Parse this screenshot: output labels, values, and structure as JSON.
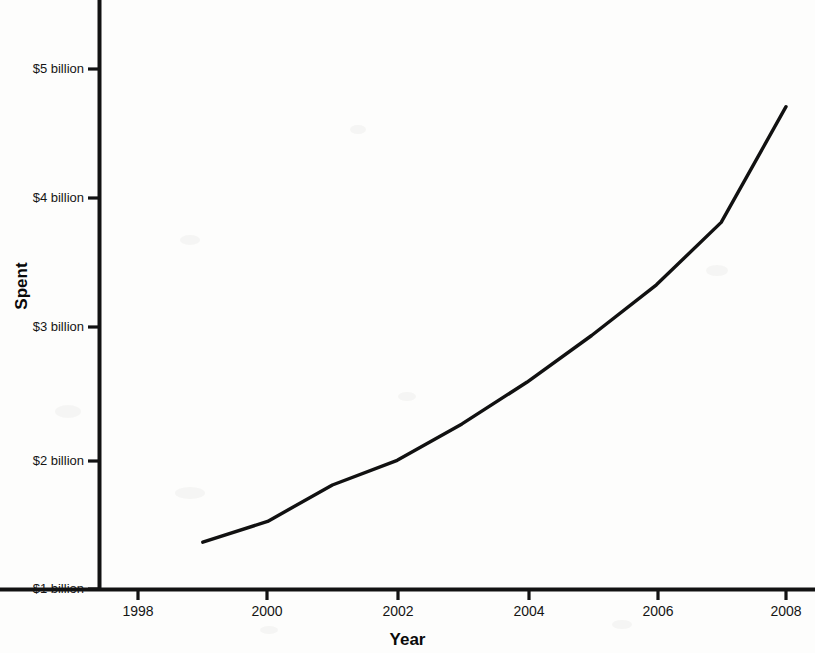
{
  "chart_data": {
    "type": "line",
    "title": "",
    "xlabel": "Year",
    "ylabel": "Spent",
    "x": [
      1999,
      2000,
      2001,
      2002,
      2003,
      2004,
      2005,
      2006,
      2007,
      2008
    ],
    "values": [
      1.36,
      1.52,
      1.8,
      1.99,
      2.27,
      2.59,
      2.95,
      3.34,
      3.82,
      4.71
    ],
    "series": [
      {
        "name": "Spent",
        "values": [
          1.36,
          1.52,
          1.8,
          1.99,
          2.27,
          2.59,
          2.95,
          3.34,
          3.82,
          4.71
        ]
      }
    ],
    "xlim": [
      1997.3,
      2008.3
    ],
    "ylim": [
      1,
      5.45
    ],
    "xticks": [
      1998,
      2000,
      2002,
      2004,
      2006,
      2008
    ],
    "xticklabels": [
      "1998",
      "2000",
      "2002",
      "2004",
      "2006",
      "2008"
    ],
    "yticks": [
      1,
      2,
      3,
      4,
      5
    ],
    "yticklabels": [
      "$1 billion",
      "$2 billion",
      "$3 billion",
      "$4 billion",
      "$5 billion"
    ],
    "grid": false,
    "legend": false,
    "line_color": "#111111",
    "line_width": 3.4
  },
  "axes": {
    "y_title": "Spent",
    "x_title": "Year",
    "y_tick_labels": [
      {
        "value": 5,
        "label": "$5 billion"
      },
      {
        "value": 4,
        "label": "$4 billion"
      },
      {
        "value": 3,
        "label": "$3 billion"
      },
      {
        "value": 2,
        "label": "$2 billion"
      },
      {
        "value": 1,
        "label": "$1 billion"
      }
    ],
    "x_tick_labels": [
      {
        "value": 1998,
        "label": "1998"
      },
      {
        "value": 2000,
        "label": "2000"
      },
      {
        "value": 2002,
        "label": "2002"
      },
      {
        "value": 2004,
        "label": "2004"
      },
      {
        "value": 2006,
        "label": "2006"
      },
      {
        "value": 2008,
        "label": "2008"
      }
    ]
  }
}
